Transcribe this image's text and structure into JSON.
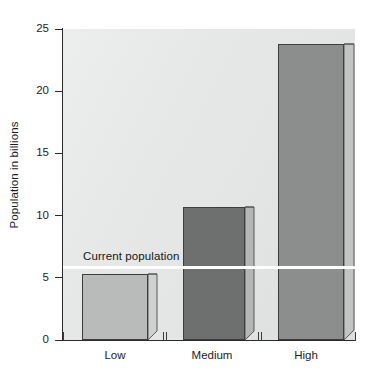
{
  "chart_data": {
    "type": "bar",
    "title": "",
    "subtitle": "",
    "xlabel": "",
    "ylabel": "Population in billions",
    "categories": [
      "Low",
      "Medium",
      "High"
    ],
    "values": [
      5.3,
      10.7,
      23.8
    ],
    "series": [
      {
        "name": "Projected population",
        "values": [
          5.3,
          10.7,
          23.8
        ]
      }
    ],
    "ylim": [
      0,
      25
    ],
    "yticks": [
      0,
      5,
      10,
      15,
      20,
      25
    ],
    "ytick_labels": [
      "0",
      "5",
      "10",
      "15",
      "20",
      "25"
    ],
    "grid": false,
    "legend": false,
    "legend_position": "none",
    "annotations": [
      {
        "label": "Current population",
        "type": "hline",
        "value": 5.9,
        "color": "#ffffff"
      }
    ],
    "bar_colors": [
      "#b9bbbb",
      "#6e7070",
      "#8c8e8e"
    ],
    "plot_background": "#e6e7e7",
    "axis_color": "#2b2b2b"
  },
  "axis": {
    "y_title": "Population in billions",
    "y_ticks": [
      {
        "label": "25",
        "value": 25
      },
      {
        "label": "20",
        "value": 20
      },
      {
        "label": "15",
        "value": 15
      },
      {
        "label": "10",
        "value": 10
      },
      {
        "label": "5",
        "value": 5
      },
      {
        "label": "0",
        "value": 0
      }
    ],
    "x_labels": [
      "Low",
      "Medium",
      "High"
    ]
  },
  "bars": [
    {
      "name": "low",
      "label": "Low",
      "value": 5.3
    },
    {
      "name": "medium",
      "label": "Medium",
      "value": 10.7
    },
    {
      "name": "high",
      "label": "High",
      "value": 23.8
    }
  ],
  "annotation": {
    "label": "Current population",
    "value": 5.9
  },
  "colors": {
    "bar_low": "#b9bbbb",
    "bar_medium": "#6e7070",
    "bar_high": "#8c8e8e",
    "annotation": "#ffffff",
    "axis": "#2b2b2b",
    "text": "#1c1c1c"
  }
}
